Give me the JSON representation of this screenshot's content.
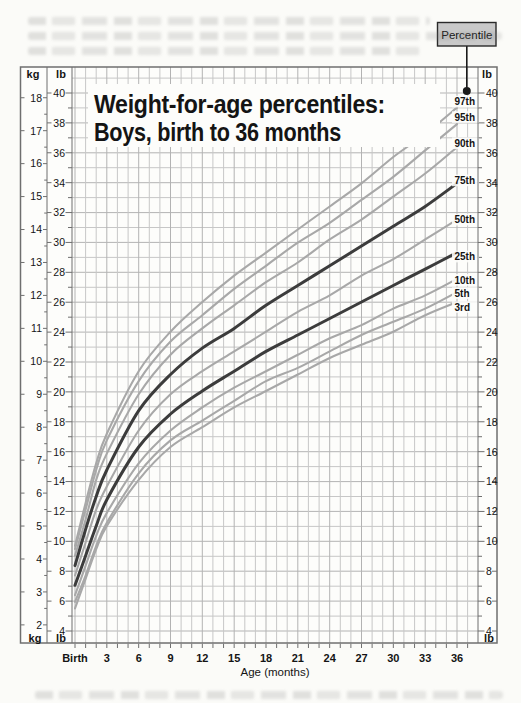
{
  "page": {
    "callout": {
      "label": "Percentile"
    },
    "axes_units": {
      "kg": "kg",
      "lb": "lb"
    }
  },
  "chart_data": {
    "type": "line",
    "title": "Weight-for-age percentiles: Boys, birth to 36 months",
    "title_line1": "Weight-for-age percentiles:",
    "title_line2": "Boys, birth to 36 months",
    "xlabel": "Age (months)",
    "x_axis": {
      "tick_months": [
        0,
        3,
        6,
        9,
        12,
        15,
        18,
        21,
        24,
        27,
        30,
        33,
        36
      ],
      "tick_labels": [
        "Birth",
        "3",
        "6",
        "9",
        "12",
        "15",
        "18",
        "21",
        "24",
        "27",
        "30",
        "33",
        "36"
      ],
      "range_months": [
        0,
        36
      ]
    },
    "y_axis_lb": {
      "unit": "lb",
      "tick_values": [
        4,
        6,
        8,
        10,
        12,
        14,
        16,
        18,
        20,
        22,
        24,
        26,
        28,
        30,
        32,
        34,
        36,
        38,
        40
      ],
      "range": [
        4,
        41
      ]
    },
    "y_axis_kg": {
      "unit": "kg",
      "tick_values": [
        2,
        3,
        4,
        5,
        6,
        7,
        8,
        9,
        10,
        11,
        12,
        13,
        14,
        15,
        16,
        17,
        18
      ],
      "range": [
        2,
        18
      ]
    },
    "grid": "on",
    "x_months": [
      0,
      1,
      2,
      3,
      6,
      9,
      12,
      15,
      18,
      21,
      24,
      27,
      30,
      33,
      36
    ],
    "series": [
      {
        "name": "97th",
        "emphasis": false,
        "values_kg": [
          4.4,
          5.7,
          6.9,
          7.8,
          9.7,
          10.9,
          11.8,
          12.6,
          13.3,
          14.0,
          14.7,
          15.4,
          16.2,
          16.9,
          17.7
        ]
      },
      {
        "name": "95th",
        "emphasis": false,
        "values_kg": [
          4.3,
          5.5,
          6.7,
          7.6,
          9.4,
          10.6,
          11.4,
          12.2,
          12.9,
          13.6,
          14.2,
          14.9,
          15.6,
          16.4,
          17.2
        ]
      },
      {
        "name": "90th",
        "emphasis": false,
        "values_kg": [
          4.1,
          5.2,
          6.4,
          7.2,
          9.0,
          10.2,
          11.0,
          11.7,
          12.4,
          13.0,
          13.7,
          14.3,
          15.0,
          15.7,
          16.5
        ]
      },
      {
        "name": "75th",
        "emphasis": true,
        "values_kg": [
          3.8,
          4.9,
          5.9,
          6.7,
          8.5,
          9.6,
          10.4,
          11.0,
          11.7,
          12.3,
          12.9,
          13.5,
          14.1,
          14.7,
          15.4
        ]
      },
      {
        "name": "50th",
        "emphasis": false,
        "values_kg": [
          3.5,
          4.5,
          5.5,
          6.2,
          7.9,
          9.0,
          9.7,
          10.3,
          10.9,
          11.5,
          12.0,
          12.6,
          13.1,
          13.7,
          14.3
        ]
      },
      {
        "name": "25th",
        "emphasis": true,
        "values_kg": [
          3.2,
          4.1,
          5.0,
          5.8,
          7.4,
          8.4,
          9.1,
          9.7,
          10.3,
          10.8,
          11.3,
          11.8,
          12.3,
          12.8,
          13.3
        ]
      },
      {
        "name": "10th",
        "emphasis": false,
        "values_kg": [
          2.9,
          3.8,
          4.7,
          5.4,
          6.9,
          7.9,
          8.6,
          9.2,
          9.7,
          10.2,
          10.7,
          11.1,
          11.6,
          12.0,
          12.5
        ]
      },
      {
        "name": "5th",
        "emphasis": false,
        "values_kg": [
          2.7,
          3.5,
          4.4,
          5.1,
          6.6,
          7.6,
          8.2,
          8.8,
          9.4,
          9.8,
          10.3,
          10.8,
          11.2,
          11.6,
          12.1
        ]
      },
      {
        "name": "3rd",
        "emphasis": false,
        "values_kg": [
          2.5,
          3.4,
          4.3,
          5.0,
          6.4,
          7.4,
          8.0,
          8.6,
          9.1,
          9.6,
          10.1,
          10.5,
          10.9,
          11.4,
          11.8
        ]
      }
    ],
    "colors": {
      "background": "#fdfdfb",
      "grid_minor": "#c7c7c7",
      "grid_major": "#b3b3b3",
      "frame": "#6f6f6f",
      "curve": "#a8a8a8",
      "curve_emphasis": "#3c3c3c",
      "callout_fill": "#c9c9c9",
      "ink": "#141414"
    }
  }
}
